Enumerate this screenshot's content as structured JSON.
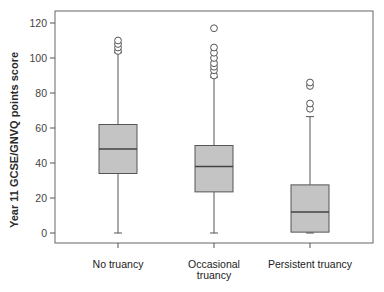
{
  "chart_data": {
    "type": "box",
    "title": "",
    "xlabel": "",
    "ylabel": "Year 11 GCSE/GNVQ points score",
    "ylim": [
      0,
      120
    ],
    "yticks": [
      0,
      20,
      40,
      60,
      80,
      100,
      120
    ],
    "grid": false,
    "legend": null,
    "categories": [
      "No truancy",
      "Occasional truancy",
      "Persistent truancy"
    ],
    "category_label_lines": [
      [
        "No truancy"
      ],
      [
        "Occasional",
        "truancy"
      ],
      [
        "Persistent truancy"
      ]
    ],
    "boxes": [
      {
        "category": "No truancy",
        "whisker_low": 0,
        "q1": 34,
        "median": 48,
        "q3": 62,
        "whisker_high": 103,
        "outliers": [
          104,
          106,
          108,
          110
        ]
      },
      {
        "category": "Occasional truancy",
        "whisker_low": 0,
        "q1": 23.5,
        "median": 38,
        "q3": 50,
        "whisker_high": 89,
        "outliers": [
          90,
          93,
          95,
          97,
          100,
          103,
          106,
          117
        ]
      },
      {
        "category": "Persistent truancy",
        "whisker_low": 0,
        "q1": 0.5,
        "median": 12,
        "q3": 27.5,
        "whisker_high": 66.5,
        "outliers": [
          71,
          74,
          84,
          86
        ]
      }
    ],
    "colors": {
      "box_fill": "#c4c4c4",
      "box_stroke": "#555555",
      "axis": "#555555",
      "outlier_stroke": "#555555"
    }
  }
}
